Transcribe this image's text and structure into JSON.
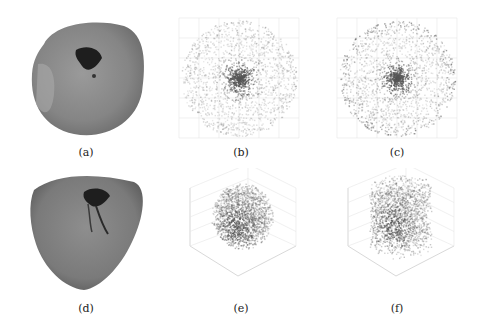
{
  "figure": {
    "panels": [
      {
        "id": "a",
        "label": "(a)",
        "type": "photo",
        "description": "tissue sample top view with dark cavity"
      },
      {
        "id": "b",
        "label": "(b)",
        "type": "scatter-2d",
        "description": "circular point cloud, dense center"
      },
      {
        "id": "c",
        "label": "(c)",
        "type": "scatter-2d",
        "description": "circular point cloud, dense rim and center"
      },
      {
        "id": "d",
        "label": "(d)",
        "type": "photo",
        "description": "tissue sample with fissure"
      },
      {
        "id": "e",
        "label": "(e)",
        "type": "scatter-3d",
        "description": "3D spherical point cloud"
      },
      {
        "id": "f",
        "label": "(f)",
        "type": "scatter-3d",
        "description": "3D cylindrical point cloud"
      }
    ]
  },
  "colors": {
    "background": "#ffffff",
    "tissue_base": "#8a8a8a",
    "tissue_dark": "#2a2a2a",
    "point": "#555555",
    "grid": "#e6e6e6"
  }
}
